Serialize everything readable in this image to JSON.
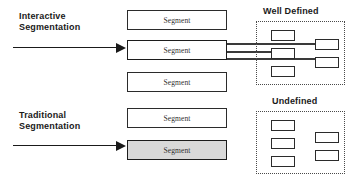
{
  "diagram": {
    "background_color": "#ffffff",
    "stroke_color": "#2b2b2b",
    "fill_shaded": "#d9d9d9",
    "rows": [
      {
        "label": "Interactive\nSegmentation",
        "arrow_name": "interactive-flow-arrow",
        "segments": [
          {
            "text": "Segment",
            "state": "normal"
          },
          {
            "text": "Segment",
            "state": "emphasis"
          },
          {
            "text": "Segment",
            "state": "normal"
          }
        ],
        "outcome": {
          "title": "Well Defined",
          "left_column": [
            "",
            "",
            ""
          ],
          "right_column": [
            "",
            ""
          ],
          "connector_count": 3
        }
      },
      {
        "label": "Traditional\nSegmentation",
        "arrow_name": "traditional-flow-arrow",
        "segments": [
          {
            "text": "Segment",
            "state": "normal"
          },
          {
            "text": "Segment",
            "state": "filled"
          }
        ],
        "outcome": {
          "title": "Undefined",
          "left_column": [
            "",
            "",
            ""
          ],
          "right_column": [
            "",
            ""
          ],
          "connector_count": 0
        }
      }
    ],
    "labels": {
      "interactive": "Interactive\nSegmentation",
      "traditional": "Traditional\nSegmentation",
      "well_defined": "Well Defined",
      "undefined": "Undefined",
      "segment": "Segment"
    }
  }
}
